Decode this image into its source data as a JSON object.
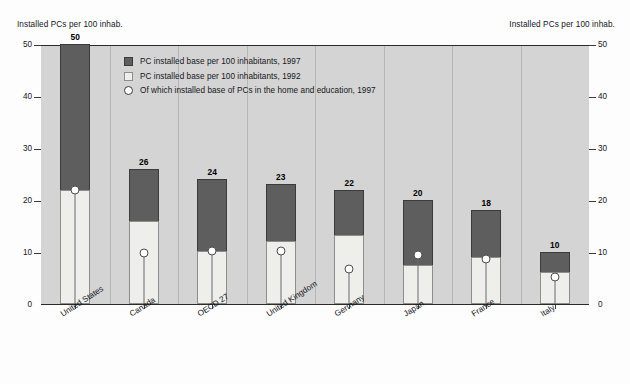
{
  "axis_titles": {
    "left": "Installed PCs per 100 inhab.",
    "right": "Installed PCs per 100 inhab."
  },
  "legend": {
    "items": [
      {
        "marker": "dark-square-swatch",
        "label": "PC installed base per 100 inhabitants, 1997"
      },
      {
        "marker": "light-square-swatch",
        "label": "PC installed base per 100 inhabitants, 1992"
      },
      {
        "marker": "white-circle-swatch",
        "label": "Of which installed base of PCs in the home and education, 1997"
      }
    ]
  },
  "chart_data": {
    "type": "bar",
    "title": "",
    "xlabel": "",
    "ylabel": "Installed PCs per 100 inhab.",
    "ylim": [
      0,
      50
    ],
    "yticks": [
      0,
      10,
      20,
      30,
      40,
      50
    ],
    "ytick_labels": [
      "0",
      "10",
      "20",
      "30",
      "40",
      "50"
    ],
    "grid": false,
    "legend_position": "inside-top-left",
    "categories": [
      "United States",
      "Canada",
      "OECD 27",
      "United Kingdom",
      "Germany",
      "Japan",
      "France",
      "Italy"
    ],
    "series": [
      {
        "name": "PC installed base per 100 inhabitants, 1997",
        "values": [
          50,
          26,
          24,
          23,
          22,
          20,
          18,
          10
        ],
        "labels": [
          "50",
          "26",
          "24",
          "23",
          "22",
          "20",
          "18",
          "10"
        ]
      },
      {
        "name": "PC installed base per 100 inhabitants, 1992",
        "values": [
          22,
          16,
          10.2,
          12.2,
          13.3,
          7.5,
          9,
          6.2
        ]
      },
      {
        "name": "Of which installed base of PCs in the home and education, 1997",
        "values": [
          22,
          9.8,
          10.2,
          10.2,
          6.7,
          9.5,
          8.6,
          5.1
        ]
      }
    ]
  }
}
